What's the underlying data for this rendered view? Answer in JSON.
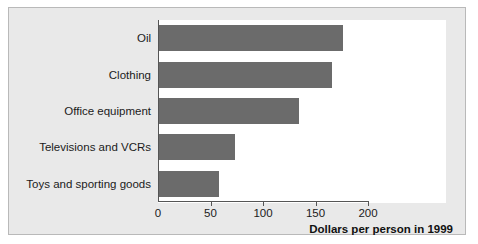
{
  "chart_data": {
    "type": "bar",
    "orientation": "horizontal",
    "title": "",
    "xlabel": "Dollars per person in 1999",
    "ylabel": "",
    "categories": [
      "Oil",
      "Clothing",
      "Office equipment",
      "Televisions and VCRs",
      "Toys and sporting goods"
    ],
    "values": [
      175,
      165,
      133,
      72,
      57
    ],
    "xlim": [
      0,
      200
    ],
    "xticks": [
      0,
      50,
      100,
      150,
      200
    ],
    "xtick_labels": [
      "0",
      "50",
      "100",
      "150",
      "200"
    ],
    "grid": false,
    "legend": null,
    "bar_color": "#6b6b6b",
    "plot_background": "#ffffff",
    "figure_background": "#e9e9e9",
    "axis_color": "#555555",
    "text_color": "#1b1b1b"
  }
}
